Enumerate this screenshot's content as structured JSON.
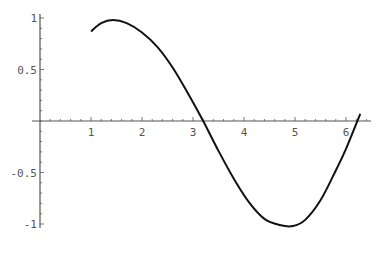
{
  "chart_data": {
    "type": "line",
    "title": "",
    "xlabel": "",
    "ylabel": "",
    "xlim": [
      0,
      6.45
    ],
    "ylim": [
      -1.05,
      1.05
    ],
    "grid": false,
    "legend": null,
    "x_ticks": [
      "1",
      "2",
      "3",
      "4",
      "5",
      "6"
    ],
    "y_ticks": [
      "1",
      "0.5",
      "-0.5",
      "-1"
    ],
    "series": [
      {
        "name": "f(x)",
        "color": "#111111",
        "x": [
          1.0,
          1.2,
          1.43,
          1.7,
          2.0,
          2.3,
          2.6,
          2.9,
          3.2,
          3.5,
          3.8,
          4.1,
          4.4,
          4.7,
          4.96,
          5.2,
          5.5,
          5.8,
          6.0,
          6.28
        ],
        "y": [
          0.87,
          0.95,
          0.98,
          0.95,
          0.86,
          0.72,
          0.52,
          0.27,
          0.0,
          -0.29,
          -0.56,
          -0.79,
          -0.95,
          -1.01,
          -1.02,
          -0.96,
          -0.77,
          -0.48,
          -0.27,
          0.07
        ]
      }
    ]
  }
}
